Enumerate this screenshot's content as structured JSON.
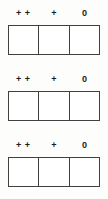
{
  "figure": {
    "type": "rating-scale-worksheet",
    "background_color": "#fdfdfc",
    "line_color": "#404040",
    "text_color": "#1c1c1c",
    "rows": [
      {
        "labels": [
          "+ +",
          "+",
          "0"
        ],
        "cells": [
          "",
          "",
          ""
        ]
      },
      {
        "labels": [
          "+ +",
          "+",
          "0"
        ],
        "cells": [
          "",
          "",
          ""
        ]
      },
      {
        "labels": [
          "+ +",
          "+",
          "0"
        ],
        "cells": [
          "",
          "",
          ""
        ]
      }
    ]
  }
}
